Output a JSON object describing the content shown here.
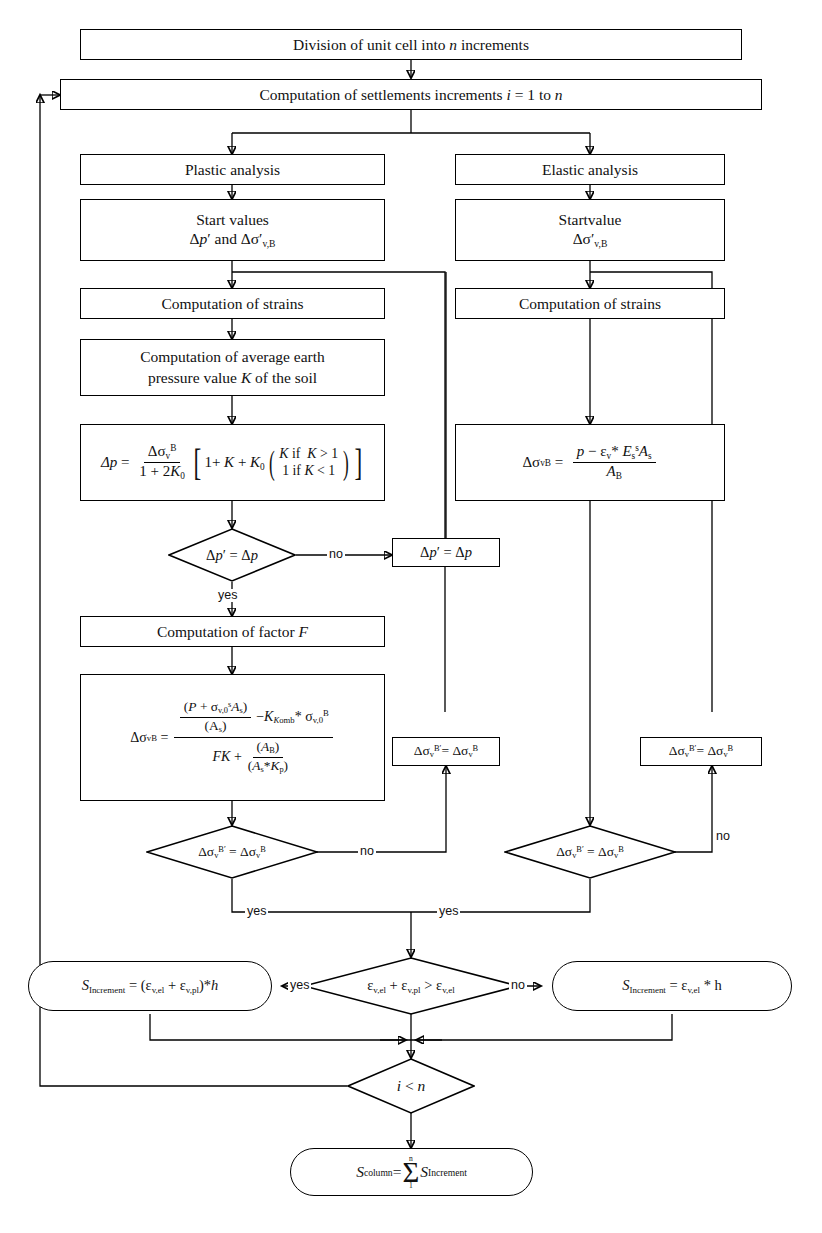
{
  "diagram": {
    "type": "flowchart",
    "nodes": {
      "division": "Division of unit cell into n increments",
      "computation_settlements": "Computation of settlements increments i = 1 to n",
      "plastic_analysis": "Plastic analysis",
      "elastic_analysis": "Elastic analysis",
      "start_values_line1": "Start values",
      "start_values_line2": "Δp′ and Δσ′v,B",
      "startvalue_line1": "Startvalue",
      "startvalue_line2": "Δσ′v,B",
      "computation_strains_left": "Computation of strains",
      "computation_strains_right": "Computation of strains",
      "avg_earth_pressure_line1": "Computation of average earth",
      "avg_earth_pressure_line2": "pressure value K of the soil",
      "formula_dp": "Δp = Δσv^B / (1 + 2K0) [ 1 + K + K0 ( K if K > 1 ; 1 if K < 1 ) ]",
      "formula_elastic": "Δσv^B = ( p − εv * Es^s As ) / AB",
      "decision_dp": "Δp′ = Δp",
      "assign_dp": "Δp′ = Δp",
      "computation_factor_f": "Computation of factor F",
      "formula_dsigma_plastic": "Δσv^B = [ (P + σ^s v,0 As)/(As) − K_Komb * σ^B v,0 ] / [ FK + (AB)/(As*Kp) ]",
      "assign_sigma_mid": "Δσv^B′ = Δσv^B",
      "assign_sigma_right": "Δσv^B′ = Δσv^B",
      "decision_sigma_left": "Δσv^B′ = Δσv^B",
      "decision_sigma_right": "Δσv^B′ = Δσv^B",
      "s_increment_plastic": "SIncrement = (εv,el + εv,pl)*h",
      "decision_strain_compare": "εv,el + εv,pl > εv,el",
      "s_increment_elastic": "SIncrement = εv,el * h",
      "decision_i_lt_n": "i < n",
      "s_column": "Scolumn = Σ(1..n) SIncrement"
    },
    "edge_labels": {
      "no_dp": "no",
      "yes_dp": "yes",
      "no_left_sigma": "no",
      "no_right_sigma": "no",
      "yes_left_sigma": "yes",
      "yes_right_sigma": "yes",
      "yes_strain": "yes",
      "no_strain": "no"
    },
    "symbols": {
      "delta": "Δ",
      "sigma": "σ",
      "epsilon": "ε",
      "sum": "Σ",
      "prime": "′"
    },
    "colors": {
      "stroke": "#000000",
      "fill": "#ffffff",
      "text": "#111111"
    }
  }
}
